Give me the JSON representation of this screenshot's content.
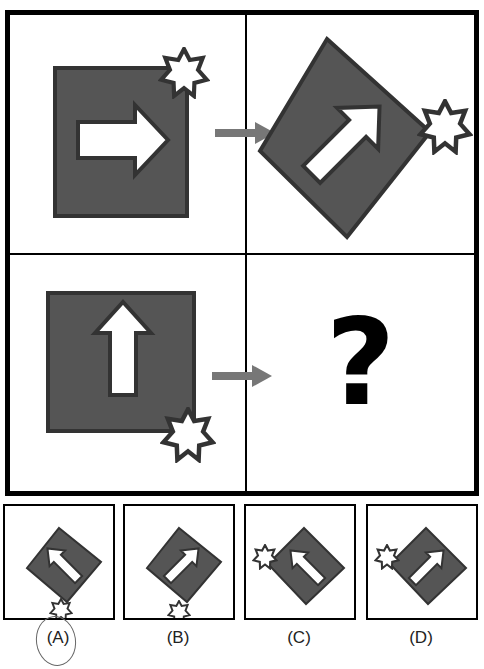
{
  "colors": {
    "square_fill": "#555555",
    "square_border": "#333333",
    "arrow_fill": "#ffffff",
    "connector_arrow": "#777777",
    "frame": "#000000",
    "question_mark": "#000000"
  },
  "puzzle": {
    "cells": [
      {
        "position": "top-left",
        "shape": "square",
        "rotation_deg": 0,
        "arrow_direction": "right",
        "star_corner": "top-right"
      },
      {
        "position": "top-right",
        "shape": "square",
        "rotation_deg": 45,
        "arrow_direction": "up-right",
        "star_corner": "right"
      },
      {
        "position": "bottom-left",
        "shape": "square",
        "rotation_deg": 0,
        "arrow_direction": "up",
        "star_corner": "bottom-right"
      },
      {
        "position": "bottom-right",
        "content": "?"
      }
    ],
    "question_mark": "?"
  },
  "options": [
    {
      "label": "(A)",
      "arrow_direction": "up-left",
      "star_corner": "bottom",
      "circled": true
    },
    {
      "label": "(B)",
      "arrow_direction": "up-right",
      "star_corner": "bottom",
      "circled": false
    },
    {
      "label": "(C)",
      "arrow_direction": "up-left",
      "star_corner": "left",
      "circled": false
    },
    {
      "label": "(D)",
      "arrow_direction": "up-right",
      "star_corner": "left",
      "circled": false
    }
  ]
}
